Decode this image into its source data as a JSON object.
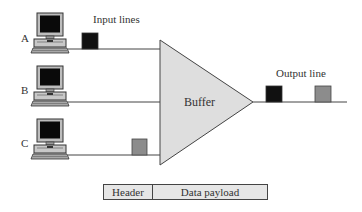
{
  "labels": {
    "input_lines": "Input lines",
    "output_line": "Output line",
    "buffer": "Buffer"
  },
  "hosts": [
    {
      "id": "A",
      "label": "A",
      "packet_color": "#111111"
    },
    {
      "id": "B",
      "label": "B",
      "packet_color": null
    },
    {
      "id": "C",
      "label": "C",
      "packet_color": "#8c8c8c"
    }
  ],
  "output_packets": [
    {
      "color": "#111111"
    },
    {
      "color": "#8c8c8c"
    }
  ],
  "packet_format": {
    "header": "Header",
    "payload": "Data payload"
  },
  "colors": {
    "buffer_fill": "#dedede",
    "line": "#444444",
    "black_packet": "#111111",
    "gray_packet": "#8c8c8c"
  }
}
